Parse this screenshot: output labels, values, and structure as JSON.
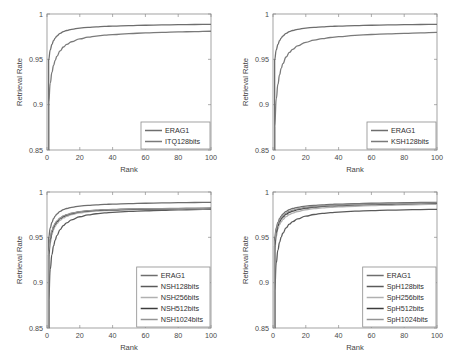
{
  "figure": {
    "background": "#ffffff",
    "axis_color": "#8c8c8c",
    "text_color": "#3a3a3a"
  },
  "chart_data": [
    {
      "id": "panel-top-left",
      "type": "line",
      "title": "",
      "xlabel": "Rank",
      "ylabel": "Retrieval Rate",
      "xlim": [
        0,
        100
      ],
      "ylim": [
        0.85,
        1
      ],
      "xticks": [
        0,
        20,
        40,
        60,
        80,
        100
      ],
      "xticklabels": [
        "0",
        "20",
        "40",
        "60",
        "80",
        "100"
      ],
      "yticks": [
        0.85,
        0.9,
        0.95,
        1
      ],
      "yticklabels": [
        "0.85",
        "0.9",
        "0.95",
        "1"
      ],
      "grid": false,
      "legend_position": "lower right",
      "x": [
        1,
        2,
        3,
        4,
        5,
        6,
        8,
        10,
        12,
        15,
        20,
        25,
        30,
        35,
        40,
        50,
        60,
        70,
        80,
        90,
        100
      ],
      "series": [
        {
          "name": "ERAG1",
          "color": "#6e6e6e",
          "width": 1.3,
          "values": [
            0.9495,
            0.9605,
            0.9665,
            0.9705,
            0.9735,
            0.9757,
            0.9786,
            0.9805,
            0.9818,
            0.9831,
            0.9845,
            0.9853,
            0.9859,
            0.9863,
            0.9867,
            0.9872,
            0.9876,
            0.9879,
            0.9882,
            0.9884,
            0.9886
          ]
        },
        {
          "name": "ITQ128bits",
          "color": "#7a7a7a",
          "width": 1.3,
          "values": [
            0.9022,
            0.9238,
            0.9356,
            0.9432,
            0.9489,
            0.9532,
            0.9594,
            0.9636,
            0.9664,
            0.9694,
            0.9725,
            0.9744,
            0.9757,
            0.9766,
            0.9773,
            0.9784,
            0.9791,
            0.9797,
            0.9802,
            0.9806,
            0.981
          ]
        }
      ]
    },
    {
      "id": "panel-top-right",
      "type": "line",
      "title": "",
      "xlabel": "Rank",
      "ylabel": "Retrieval Rate",
      "xlim": [
        0,
        100
      ],
      "ylim": [
        0.85,
        1
      ],
      "xticks": [
        0,
        20,
        40,
        60,
        80,
        100
      ],
      "xticklabels": [
        "0",
        "20",
        "40",
        "60",
        "80",
        "100"
      ],
      "yticks": [
        0.85,
        0.9,
        0.95,
        1
      ],
      "yticklabels": [
        "0.85",
        "0.9",
        "0.95",
        "1"
      ],
      "grid": false,
      "legend_position": "lower right",
      "x": [
        1,
        2,
        3,
        4,
        5,
        6,
        8,
        10,
        12,
        15,
        20,
        25,
        30,
        35,
        40,
        50,
        60,
        70,
        80,
        90,
        100
      ],
      "series": [
        {
          "name": "ERAG1",
          "color": "#6e6e6e",
          "width": 1.3,
          "values": [
            0.9495,
            0.9605,
            0.9665,
            0.9705,
            0.9735,
            0.9757,
            0.9786,
            0.9805,
            0.9818,
            0.9831,
            0.9845,
            0.9853,
            0.9859,
            0.9863,
            0.9867,
            0.9872,
            0.9876,
            0.9879,
            0.9882,
            0.9884,
            0.9886
          ]
        },
        {
          "name": "KSH128bits",
          "color": "#7a7a7a",
          "width": 1.3,
          "values": [
            0.8755,
            0.9065,
            0.9225,
            0.9328,
            0.94,
            0.9452,
            0.9526,
            0.9576,
            0.961,
            0.9648,
            0.9688,
            0.9712,
            0.9729,
            0.9741,
            0.975,
            0.9764,
            0.9774,
            0.9781,
            0.9787,
            0.9792,
            0.9797
          ]
        }
      ]
    },
    {
      "id": "panel-bottom-left",
      "type": "line",
      "title": "",
      "xlabel": "Rank",
      "ylabel": "Retrieval Rate",
      "xlim": [
        0,
        100
      ],
      "ylim": [
        0.85,
        1
      ],
      "xticks": [
        0,
        20,
        40,
        60,
        80,
        100
      ],
      "xticklabels": [
        "0",
        "20",
        "40",
        "60",
        "80",
        "100"
      ],
      "yticks": [
        0.85,
        0.9,
        0.95,
        1
      ],
      "yticklabels": [
        "0.85",
        "0.9",
        "0.95",
        "1"
      ],
      "grid": false,
      "legend_position": "lower right",
      "x": [
        1,
        2,
        3,
        4,
        5,
        6,
        8,
        10,
        12,
        15,
        20,
        25,
        30,
        35,
        40,
        50,
        60,
        70,
        80,
        90,
        100
      ],
      "series": [
        {
          "name": "ERAG1",
          "color": "#6e6e6e",
          "width": 1.3,
          "values": [
            0.9495,
            0.9605,
            0.9665,
            0.9705,
            0.9735,
            0.9757,
            0.9786,
            0.9805,
            0.9818,
            0.9831,
            0.9845,
            0.9853,
            0.9859,
            0.9863,
            0.9867,
            0.9872,
            0.9876,
            0.9879,
            0.9882,
            0.9884,
            0.9886
          ]
        },
        {
          "name": "NSH128bits",
          "color": "#5a5a5a",
          "width": 1.3,
          "values": [
            0.88,
            0.915,
            0.931,
            0.9405,
            0.947,
            0.9518,
            0.9585,
            0.963,
            0.966,
            0.9693,
            0.9727,
            0.9747,
            0.976,
            0.9769,
            0.9776,
            0.9786,
            0.9793,
            0.9798,
            0.9802,
            0.9806,
            0.9809
          ]
        },
        {
          "name": "NSH256bits",
          "color": "#b0b0b0",
          "width": 1.3,
          "values": [
            0.925,
            0.944,
            0.953,
            0.9585,
            0.9622,
            0.965,
            0.9688,
            0.9714,
            0.9731,
            0.975,
            0.977,
            0.9782,
            0.9789,
            0.9794,
            0.9798,
            0.9803,
            0.9807,
            0.981,
            0.9812,
            0.9814,
            0.9816
          ]
        },
        {
          "name": "NSH512bits",
          "color": "#3c3c3c",
          "width": 1.4,
          "values": [
            0.93,
            0.948,
            0.9562,
            0.9612,
            0.9646,
            0.9672,
            0.9706,
            0.973,
            0.9746,
            0.9763,
            0.9781,
            0.9791,
            0.9797,
            0.9801,
            0.9805,
            0.9809,
            0.9813,
            0.9815,
            0.9817,
            0.9818,
            0.982
          ]
        },
        {
          "name": "NSH1024bits",
          "color": "#949494",
          "width": 1.3,
          "values": [
            0.934,
            0.95,
            0.9576,
            0.9624,
            0.9656,
            0.968,
            0.9713,
            0.9736,
            0.9751,
            0.9767,
            0.9784,
            0.9794,
            0.98,
            0.9804,
            0.9807,
            0.9812,
            0.9815,
            0.9817,
            0.9819,
            0.982,
            0.9822
          ]
        }
      ]
    },
    {
      "id": "panel-bottom-right",
      "type": "line",
      "title": "",
      "xlabel": "Rank",
      "ylabel": "Retrieval Rate",
      "xlim": [
        0,
        100
      ],
      "ylim": [
        0.85,
        1
      ],
      "xticks": [
        0,
        20,
        40,
        60,
        80,
        100
      ],
      "xticklabels": [
        "0",
        "20",
        "40",
        "60",
        "80",
        "100"
      ],
      "yticks": [
        0.85,
        0.9,
        0.95,
        1
      ],
      "yticklabels": [
        "0.85",
        "0.9",
        "0.95",
        "1"
      ],
      "grid": false,
      "legend_position": "lower right",
      "x": [
        1,
        2,
        3,
        4,
        5,
        6,
        8,
        10,
        12,
        15,
        20,
        25,
        30,
        35,
        40,
        50,
        60,
        70,
        80,
        90,
        100
      ],
      "series": [
        {
          "name": "ERAG1",
          "color": "#6e6e6e",
          "width": 1.3,
          "values": [
            0.9495,
            0.9605,
            0.9665,
            0.9705,
            0.9735,
            0.9757,
            0.9786,
            0.9805,
            0.9818,
            0.9831,
            0.9845,
            0.9853,
            0.9859,
            0.9863,
            0.9867,
            0.9872,
            0.9876,
            0.9879,
            0.9882,
            0.9884,
            0.9886
          ]
        },
        {
          "name": "SpH128bits",
          "color": "#5a5a5a",
          "width": 1.3,
          "values": [
            0.89,
            0.922,
            0.936,
            0.9445,
            0.9502,
            0.9545,
            0.9604,
            0.9645,
            0.9673,
            0.9703,
            0.9734,
            0.9752,
            0.9764,
            0.9772,
            0.9779,
            0.9788,
            0.9794,
            0.9799,
            0.9803,
            0.9806,
            0.9809
          ]
        },
        {
          "name": "SpH256bits",
          "color": "#b0b0b0",
          "width": 1.3,
          "values": [
            0.933,
            0.9512,
            0.9592,
            0.964,
            0.9672,
            0.9696,
            0.9729,
            0.9752,
            0.9768,
            0.9785,
            0.9804,
            0.9816,
            0.9824,
            0.983,
            0.9835,
            0.9843,
            0.9849,
            0.9854,
            0.9858,
            0.9861,
            0.9864
          ]
        },
        {
          "name": "SpH512bits",
          "color": "#3c3c3c",
          "width": 1.4,
          "values": [
            0.94,
            0.9558,
            0.963,
            0.9674,
            0.9703,
            0.9725,
            0.9756,
            0.9777,
            0.9791,
            0.9806,
            0.9823,
            0.9834,
            0.9841,
            0.9847,
            0.9851,
            0.9858,
            0.9863,
            0.9867,
            0.9871,
            0.9874,
            0.9876
          ]
        },
        {
          "name": "SpH1024bits",
          "color": "#949494",
          "width": 1.3,
          "values": [
            0.9455,
            0.9585,
            0.965,
            0.969,
            0.9718,
            0.9738,
            0.9768,
            0.9787,
            0.98,
            0.9814,
            0.983,
            0.984,
            0.9847,
            0.9852,
            0.9856,
            0.9862,
            0.9867,
            0.9871,
            0.9874,
            0.9876,
            0.9879
          ]
        }
      ]
    }
  ]
}
